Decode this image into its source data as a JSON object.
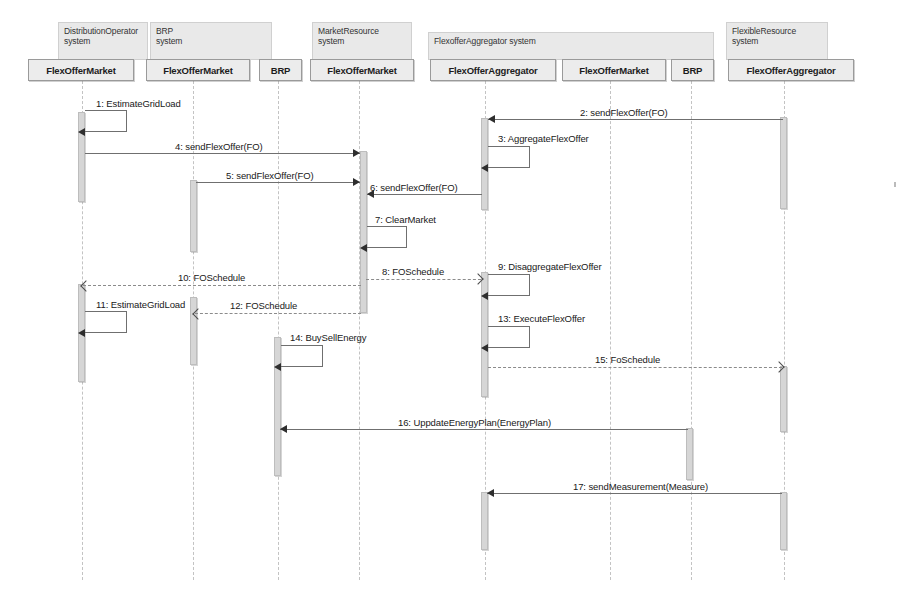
{
  "diagram": {
    "type": "uml-sequence-diagram",
    "systems": [
      {
        "id": "distribution-operator",
        "name": "DistributionOperator\nsystem",
        "x": 58,
        "y": 22,
        "w": 90,
        "h": 38
      },
      {
        "id": "brp-system",
        "name": "BRP\nsystem",
        "x": 150,
        "y": 22,
        "w": 122,
        "h": 38
      },
      {
        "id": "market-resource",
        "name": "MarketResource\nsystem",
        "x": 312,
        "y": 22,
        "w": 100,
        "h": 38
      },
      {
        "id": "flexoffer-aggregator",
        "name": "FlexofferAggregator system",
        "x": 428,
        "y": 32,
        "w": 286,
        "h": 28
      },
      {
        "id": "flexible-resource",
        "name": "FlexibleResource\nsystem",
        "x": 726,
        "y": 22,
        "w": 102,
        "h": 38
      }
    ],
    "lifelines": [
      {
        "id": "ll-do-fom",
        "label": "FlexOfferMarket",
        "box_x": 28,
        "box_y": 59,
        "box_w": 106,
        "box_h": 22,
        "center": 82,
        "bottom": 580
      },
      {
        "id": "ll-brp-fom",
        "label": "FlexOfferMarket",
        "box_x": 146,
        "box_y": 59,
        "box_w": 104,
        "box_h": 22,
        "center": 193,
        "bottom": 580
      },
      {
        "id": "ll-brp-brp",
        "label": "BRP",
        "box_x": 259,
        "box_y": 59,
        "box_w": 43,
        "box_h": 22,
        "center": 278,
        "bottom": 580
      },
      {
        "id": "ll-mr-fom",
        "label": "FlexOfferMarket",
        "box_x": 310,
        "box_y": 59,
        "box_w": 104,
        "box_h": 22,
        "center": 359,
        "bottom": 580
      },
      {
        "id": "ll-fa-foa",
        "label": "FlexOfferAggregator",
        "box_x": 430,
        "box_y": 59,
        "box_w": 126,
        "box_h": 22,
        "center": 485,
        "bottom": 580
      },
      {
        "id": "ll-fa-fom",
        "label": "FlexOfferMarket",
        "box_x": 562,
        "box_y": 59,
        "box_w": 104,
        "box_h": 22,
        "center": 610,
        "bottom": 580
      },
      {
        "id": "ll-fa-brp",
        "label": "BRP",
        "box_x": 671,
        "box_y": 59,
        "box_w": 43,
        "box_h": 22,
        "center": 691,
        "bottom": 580
      },
      {
        "id": "ll-fr-foa",
        "label": "FlexOfferAggregator",
        "box_x": 728,
        "box_y": 59,
        "box_w": 126,
        "box_h": 22,
        "center": 784,
        "bottom": 580
      }
    ],
    "activations": [
      {
        "id": "act-do-1",
        "lifeline": "ll-do-fom",
        "x": 78,
        "y": 112,
        "h": 90
      },
      {
        "id": "act-fa-1",
        "lifeline": "ll-fa-foa",
        "x": 481,
        "y": 118,
        "h": 92
      },
      {
        "id": "act-fr-1",
        "lifeline": "ll-fr-foa",
        "x": 780,
        "y": 117,
        "h": 92
      },
      {
        "id": "act-mr-1",
        "lifeline": "ll-mr-fom",
        "x": 360,
        "y": 151,
        "h": 162
      },
      {
        "id": "act-brp-1",
        "lifeline": "ll-brp-fom",
        "x": 190,
        "y": 180,
        "h": 72
      },
      {
        "id": "act-fa-2",
        "lifeline": "ll-fa-foa",
        "x": 481,
        "y": 272,
        "h": 125
      },
      {
        "id": "act-do-2",
        "lifeline": "ll-do-fom",
        "x": 78,
        "y": 284,
        "h": 98
      },
      {
        "id": "act-brp-2",
        "lifeline": "ll-brp-fom",
        "x": 190,
        "y": 297,
        "h": 68
      },
      {
        "id": "act-mr-2",
        "lifeline": "ll-mr-fom",
        "x": 274,
        "y": 337,
        "h": 139
      },
      {
        "id": "act-fr-2",
        "lifeline": "ll-fr-foa",
        "x": 780,
        "y": 366,
        "h": 66
      },
      {
        "id": "act-fa-3",
        "lifeline": "ll-fa-fom",
        "x": 686,
        "y": 428,
        "h": 52
      },
      {
        "id": "act-fa-4",
        "lifeline": "ll-fa-foa",
        "x": 481,
        "y": 492,
        "h": 58
      },
      {
        "id": "act-fr-3",
        "lifeline": "ll-fr-foa",
        "x": 780,
        "y": 492,
        "h": 58
      }
    ],
    "messages": [
      {
        "num": "1",
        "label": "1:  EstimateGridLoad",
        "kind": "self",
        "from": "ll-do-fom",
        "to": "ll-do-fom",
        "label_x": 96,
        "label_y": 98,
        "hook_x": 85,
        "hook_y": 110,
        "hook_w": 42,
        "hook_h": 22
      },
      {
        "num": "2",
        "label": "2:  sendFlexOffer(FO)",
        "kind": "call",
        "from": "ll-fr-foa",
        "to": "ll-fa-foa",
        "dir": "left",
        "y": 119,
        "x1": 488,
        "x2": 783,
        "label_x": 580,
        "label_y": 107
      },
      {
        "num": "3",
        "label": "3:  AggregateFlexOffer",
        "kind": "self",
        "from": "ll-fa-foa",
        "to": "ll-fa-foa",
        "label_x": 498,
        "label_y": 133,
        "hook_x": 488,
        "hook_y": 146,
        "hook_w": 42,
        "hook_h": 22
      },
      {
        "num": "4",
        "label": "4:  sendFlexOffer(FO)",
        "kind": "call",
        "from": "ll-do-fom",
        "to": "ll-mr-fom",
        "dir": "right",
        "y": 153,
        "x1": 85,
        "x2": 360,
        "label_x": 175,
        "label_y": 141
      },
      {
        "num": "5",
        "label": "5:  sendFlexOffer(FO)",
        "kind": "call",
        "from": "ll-brp-fom",
        "to": "ll-mr-fom",
        "dir": "right",
        "y": 182,
        "x1": 196,
        "x2": 360,
        "label_x": 226,
        "label_y": 170
      },
      {
        "num": "6",
        "label": "6:  sendFlexOffer(FO)",
        "kind": "call",
        "from": "ll-fa-foa",
        "to": "ll-mr-fom",
        "dir": "left",
        "y": 194,
        "x1": 367,
        "x2": 482,
        "label_x": 370,
        "label_y": 182
      },
      {
        "num": "7",
        "label": "7:  ClearMarket",
        "kind": "self",
        "from": "ll-mr-fom",
        "to": "ll-mr-fom",
        "label_x": 375,
        "label_y": 214,
        "hook_x": 367,
        "hook_y": 226,
        "hook_w": 40,
        "hook_h": 22
      },
      {
        "num": "8",
        "label": "8:  FOSchedule",
        "kind": "return",
        "from": "ll-mr-fom",
        "to": "ll-fa-foa",
        "dir": "right",
        "y": 279,
        "x1": 366,
        "x2": 481,
        "label_x": 382,
        "label_y": 266
      },
      {
        "num": "9",
        "label": "9:  DisaggregateFlexOffer",
        "kind": "self",
        "from": "ll-fa-foa",
        "to": "ll-fa-foa",
        "label_x": 498,
        "label_y": 261,
        "hook_x": 488,
        "hook_y": 274,
        "hook_w": 42,
        "hook_h": 22
      },
      {
        "num": "10",
        "label": "10:  FOSchedule",
        "kind": "return",
        "from": "ll-mr-fom",
        "to": "ll-do-fom",
        "dir": "left",
        "y": 285,
        "x1": 83,
        "x2": 361,
        "label_x": 178,
        "label_y": 272
      },
      {
        "num": "11",
        "label": "11:  EstimateGridLoad",
        "kind": "self",
        "from": "ll-do-fom",
        "to": "ll-do-fom",
        "label_x": 96,
        "label_y": 299,
        "hook_x": 85,
        "hook_y": 311,
        "hook_w": 42,
        "hook_h": 22
      },
      {
        "num": "12",
        "label": "12:  FOSchedule",
        "kind": "return",
        "from": "ll-mr-fom",
        "to": "ll-brp-fom",
        "dir": "left",
        "y": 313,
        "x1": 195,
        "x2": 361,
        "label_x": 230,
        "label_y": 300
      },
      {
        "num": "13",
        "label": "13:  ExecuteFlexOffer",
        "kind": "self",
        "from": "ll-fa-foa",
        "to": "ll-fa-foa",
        "label_x": 498,
        "label_y": 313,
        "hook_x": 488,
        "hook_y": 326,
        "hook_w": 42,
        "hook_h": 22
      },
      {
        "num": "14",
        "label": "14:  BuySellEnergy",
        "kind": "self",
        "from": "ll-mr-fom",
        "to": "ll-mr-fom",
        "label_x": 290,
        "label_y": 332,
        "hook_x": 281,
        "hook_y": 345,
        "hook_w": 42,
        "hook_h": 22
      },
      {
        "num": "15",
        "label": "15:  FoSchedule",
        "kind": "return",
        "from": "ll-fa-foa",
        "to": "ll-fr-foa",
        "dir": "right",
        "y": 367,
        "x1": 488,
        "x2": 782,
        "label_x": 595,
        "label_y": 354
      },
      {
        "num": "16",
        "label": "16:  UppdateEnergyPlan(EnergyPlan)",
        "kind": "call",
        "from": "ll-fa-fom",
        "to": "ll-mr-fom",
        "dir": "left",
        "y": 429,
        "x1": 280,
        "x2": 688,
        "label_x": 398,
        "label_y": 417
      },
      {
        "num": "17",
        "label": "17:  sendMeasurement(Measure)",
        "kind": "call",
        "from": "ll-fr-foa",
        "to": "ll-fa-foa",
        "dir": "left",
        "y": 493,
        "x1": 487,
        "x2": 782,
        "label_x": 573,
        "label_y": 481
      }
    ],
    "colors": {
      "background": "#ffffff",
      "box_fill": "#ececec",
      "box_border": "#9a9a9a",
      "group_fill": "#e9e9e9",
      "activation_fill": "#d6d6d6",
      "line": "#6f6f6f",
      "return_line": "#8b8b8b",
      "text": "#202020"
    }
  }
}
